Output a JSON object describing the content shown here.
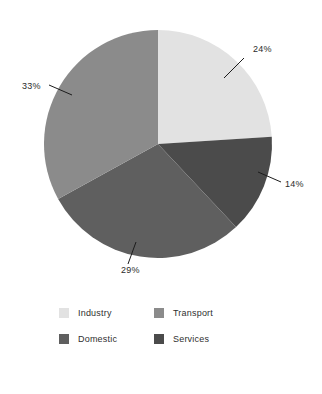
{
  "chart_data": {
    "type": "pie",
    "title": "",
    "legend_position": "bottom",
    "start_angle_deg": 0,
    "direction": "clockwise",
    "center": {
      "x": 158,
      "y": 144
    },
    "radius": 114,
    "categories": [
      "Industry",
      "Services",
      "Domestic",
      "Transport"
    ],
    "values": [
      24,
      14,
      29,
      33
    ],
    "unit": "%",
    "slices": [
      {
        "name": "Industry",
        "value": 24,
        "label": "24%",
        "color": "#e2e2e2",
        "start_deg": 0,
        "end_deg": 86.4,
        "label_x": 253,
        "label_y": 52,
        "leader_x1": 244,
        "leader_y1": 58,
        "leader_x2": 224,
        "leader_y2": 78
      },
      {
        "name": "Services",
        "value": 14,
        "label": "14%",
        "color": "#4b4b4b",
        "start_deg": 86.4,
        "end_deg": 136.8,
        "label_x": 285,
        "label_y": 187,
        "leader_x1": 281,
        "leader_y1": 182,
        "leader_x2": 258,
        "leader_y2": 172
      },
      {
        "name": "Domestic",
        "value": 29,
        "label": "29%",
        "color": "#5f5f5f",
        "start_deg": 136.8,
        "end_deg": 241.2,
        "label_x": 121,
        "label_y": 273,
        "leader_x1": 128,
        "leader_y1": 264,
        "leader_x2": 136,
        "leader_y2": 242
      },
      {
        "name": "Transport",
        "value": 33,
        "label": "33%",
        "color": "#8b8b8b",
        "start_deg": 241.2,
        "end_deg": 360,
        "label_x": 22,
        "label_y": 89,
        "leader_x1": 49,
        "leader_y1": 85,
        "leader_x2": 72,
        "leader_y2": 95
      }
    ],
    "legend": [
      {
        "label": "Industry",
        "color": "#e2e2e2"
      },
      {
        "label": "Transport",
        "color": "#8b8b8b"
      },
      {
        "label": "Domestic",
        "color": "#5f5f5f"
      },
      {
        "label": "Services",
        "color": "#4b4b4b"
      }
    ],
    "background_color": "#ffffff"
  }
}
